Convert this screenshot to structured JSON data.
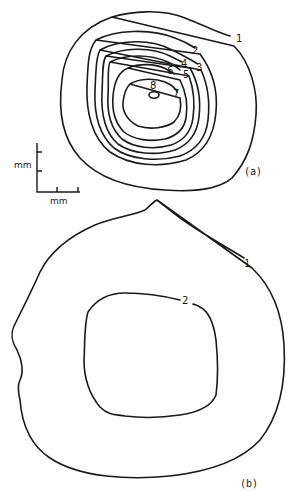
{
  "figure": {
    "panels": [
      {
        "id": "a",
        "label": "(a)",
        "contour_labels": [
          "1",
          "2",
          "3",
          "4",
          "5",
          "6",
          "7",
          "8"
        ]
      },
      {
        "id": "b",
        "label": "(b)",
        "contour_labels": [
          "1",
          "2"
        ]
      }
    ],
    "scale_bar": {
      "vertical_unit": "mm",
      "horizontal_unit": "mm"
    },
    "colors": {
      "line": "#1a1a1a",
      "background": "#ffffff"
    }
  }
}
